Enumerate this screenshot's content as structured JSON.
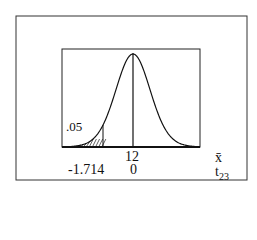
{
  "chart_data": {
    "type": "area",
    "title": "",
    "distribution": "t",
    "degrees_of_freedom": 23,
    "shaded_tail": "left",
    "tail_area_label": ".05",
    "critical_value_label": "-1.714",
    "center_xbar_label": "12",
    "center_t_label": "0",
    "axis_labels": {
      "xbar": "x̄",
      "t_main": "t",
      "t_sub": "23"
    },
    "critical_t": -1.714,
    "tail_area": 0.05,
    "center_xbar": 12,
    "center_t": 0
  }
}
